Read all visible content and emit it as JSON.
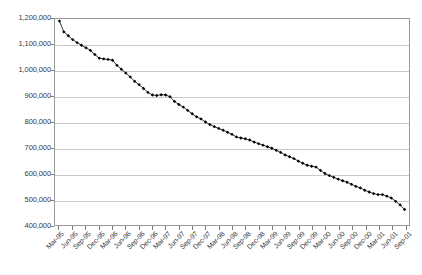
{
  "chart_data": {
    "type": "line",
    "title": "",
    "subtitle": "",
    "xlabel": "",
    "ylabel": "",
    "ylim": [
      400000,
      1200000
    ],
    "ytick_values": [
      400000,
      500000,
      600000,
      700000,
      800000,
      900000,
      1000000,
      1100000,
      1200000
    ],
    "ytick_labels": [
      "400,000",
      "500,000",
      "600,000",
      "700,000",
      "800,000",
      "900,000",
      "1,000,000",
      "1,100,000",
      "1,200,000"
    ],
    "grid": true,
    "grid_axis": "y",
    "legend": false,
    "legend_position": "none",
    "marker": "diamond",
    "marker_color": "#000000",
    "line_color": "#000000",
    "xtick_labels": [
      "Mar-95",
      "Jun-95",
      "Sep-95",
      "Dec-95",
      "Mar-96",
      "Jun-96",
      "Sep-96",
      "Dec-96",
      "Mar-97",
      "Jun-97",
      "Sep-97",
      "Dec-97",
      "Mar-98",
      "Jun-98",
      "Sep-98",
      "Dec-98",
      "Mar-99",
      "Jun-99",
      "Sep-99",
      "Dec-99",
      "Mar-00",
      "Jun-00",
      "Sep-00",
      "Dec-00",
      "Mar-01",
      "Jun-01",
      "Sep-01"
    ],
    "xtick_interval_months": 3,
    "x": [
      "Mar-95",
      "Apr-95",
      "May-95",
      "Jun-95",
      "Jul-95",
      "Aug-95",
      "Sep-95",
      "Oct-95",
      "Nov-95",
      "Dec-95",
      "Jan-96",
      "Feb-96",
      "Mar-96",
      "Apr-96",
      "May-96",
      "Jun-96",
      "Jul-96",
      "Aug-96",
      "Sep-96",
      "Oct-96",
      "Nov-96",
      "Dec-96",
      "Jan-97",
      "Feb-97",
      "Mar-97",
      "Apr-97",
      "May-97",
      "Jun-97",
      "Jul-97",
      "Aug-97",
      "Sep-97",
      "Oct-97",
      "Nov-97",
      "Dec-97",
      "Jan-98",
      "Feb-98",
      "Mar-98",
      "Apr-98",
      "May-98",
      "Jun-98",
      "Jul-98",
      "Aug-98",
      "Sep-98",
      "Oct-98",
      "Nov-98",
      "Dec-98",
      "Jan-99",
      "Feb-99",
      "Mar-99",
      "Apr-99",
      "May-99",
      "Jun-99",
      "Jul-99",
      "Aug-99",
      "Sep-99",
      "Oct-99",
      "Nov-99",
      "Dec-99",
      "Jan-00",
      "Feb-00",
      "Mar-00",
      "Apr-00",
      "May-00",
      "Jun-00",
      "Jul-00",
      "Aug-00",
      "Sep-00",
      "Oct-00",
      "Nov-00",
      "Dec-00",
      "Jan-01",
      "Feb-01",
      "Mar-01",
      "Apr-01",
      "May-01",
      "Jun-01",
      "Jul-01",
      "Aug-01",
      "Sep-01"
    ],
    "values": [
      1192000,
      1150000,
      1135000,
      1120000,
      1108000,
      1098000,
      1088000,
      1078000,
      1062000,
      1048000,
      1045000,
      1043000,
      1040000,
      1020000,
      1005000,
      990000,
      975000,
      958000,
      945000,
      930000,
      915000,
      905000,
      903000,
      906000,
      905000,
      898000,
      880000,
      868000,
      858000,
      845000,
      832000,
      820000,
      812000,
      800000,
      790000,
      782000,
      775000,
      768000,
      760000,
      752000,
      742000,
      738000,
      735000,
      730000,
      722000,
      716000,
      710000,
      704000,
      698000,
      690000,
      682000,
      672000,
      665000,
      658000,
      648000,
      640000,
      632000,
      628000,
      625000,
      612000,
      600000,
      592000,
      585000,
      578000,
      572000,
      566000,
      558000,
      550000,
      544000,
      535000,
      528000,
      522000,
      518000,
      518000,
      512000,
      505000,
      492000,
      478000,
      460000
    ]
  }
}
